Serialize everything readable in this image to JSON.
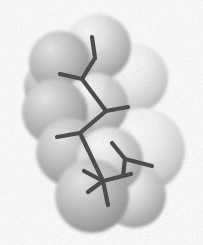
{
  "image": {
    "title": "Space-filling molecular model with stick skeleton",
    "subject": "branched alkane molecule",
    "representation": "van der Waals surface (CPK) with overlaid wireframe bonds",
    "background_color": "#ffffff",
    "width": 203,
    "height": 245,
    "color_mode": "grayscale",
    "texture": "dithered / halftone stippling"
  },
  "palette": {
    "background": "#ffffff",
    "sphere_light": "#f2f2f2",
    "sphere_mid": "#c9c9c9",
    "sphere_dark": "#9a9a9a",
    "sphere_edge": "#8a8a8a",
    "highlight": "#fbfbfb",
    "bond_color": "#3b3b3b",
    "bond_shadow": "#2b2b2b"
  },
  "surface": {
    "label": "van-der-waals-surface",
    "atom_count": 11,
    "atoms": [
      {
        "id": "sphere-1",
        "cx": 98,
        "cy": 47,
        "r": 33,
        "tone": "#c4c4c4",
        "light": "#eeeeee"
      },
      {
        "id": "sphere-2",
        "cx": 60,
        "cy": 62,
        "r": 31,
        "tone": "#b4b4b4",
        "light": "#e2e2e2"
      },
      {
        "id": "sphere-3",
        "cx": 133,
        "cy": 78,
        "r": 35,
        "tone": "#cfcfcf",
        "light": "#f4f4f4"
      },
      {
        "id": "sphere-4",
        "cx": 55,
        "cy": 112,
        "r": 33,
        "tone": "#b0b0b0",
        "light": "#dedede"
      },
      {
        "id": "sphere-5",
        "cx": 96,
        "cy": 105,
        "r": 32,
        "tone": "#c6c6c6",
        "light": "#efefef"
      },
      {
        "id": "sphere-6",
        "cx": 143,
        "cy": 150,
        "r": 42,
        "tone": "#dcdcdc",
        "light": "#fafafa"
      },
      {
        "id": "sphere-7",
        "cx": 70,
        "cy": 152,
        "r": 34,
        "tone": "#b6b6b6",
        "light": "#e4e4e4"
      },
      {
        "id": "sphere-8",
        "cx": 110,
        "cy": 160,
        "r": 33,
        "tone": "#c0c0c0",
        "light": "#ececec"
      },
      {
        "id": "sphere-9",
        "cx": 92,
        "cy": 196,
        "r": 37,
        "tone": "#a9a9a9",
        "light": "#d8d8d8"
      },
      {
        "id": "sphere-10",
        "cx": 134,
        "cy": 196,
        "r": 32,
        "tone": "#bdbdbd",
        "light": "#e8e8e8"
      },
      {
        "id": "sphere-11",
        "cx": 48,
        "cy": 86,
        "r": 24,
        "tone": "#a8a8a8",
        "light": "#d4d4d4"
      }
    ]
  },
  "skeleton": {
    "label": "bond-wireframe",
    "bond_width": 4.2,
    "vertices": [
      {
        "id": "v1",
        "x": 95,
        "y": 58,
        "type": "backbone"
      },
      {
        "id": "v2",
        "x": 82,
        "y": 79,
        "type": "branch"
      },
      {
        "id": "v3",
        "x": 106,
        "y": 111,
        "type": "branch"
      },
      {
        "id": "v4",
        "x": 80,
        "y": 133,
        "type": "branch"
      },
      {
        "id": "v5",
        "x": 103,
        "y": 181,
        "type": "branch"
      },
      {
        "id": "v6",
        "x": 125,
        "y": 159,
        "type": "branch"
      }
    ],
    "bonds": [
      {
        "id": "b1",
        "x1": 95,
        "y1": 58,
        "x2": 82,
        "y2": 79
      },
      {
        "id": "b2",
        "x1": 95,
        "y1": 58,
        "x2": 92,
        "y2": 37
      },
      {
        "id": "b3",
        "x1": 82,
        "y1": 79,
        "x2": 60,
        "y2": 74
      },
      {
        "id": "b4",
        "x1": 82,
        "y1": 79,
        "x2": 106,
        "y2": 111
      },
      {
        "id": "b5",
        "x1": 106,
        "y1": 111,
        "x2": 128,
        "y2": 107
      },
      {
        "id": "b6",
        "x1": 106,
        "y1": 111,
        "x2": 80,
        "y2": 133
      },
      {
        "id": "b7",
        "x1": 80,
        "y1": 133,
        "x2": 57,
        "y2": 137
      },
      {
        "id": "b8",
        "x1": 80,
        "y1": 133,
        "x2": 103,
        "y2": 181
      },
      {
        "id": "b9",
        "x1": 103,
        "y1": 181,
        "x2": 84,
        "y2": 171
      },
      {
        "id": "b10",
        "x1": 103,
        "y1": 181,
        "x2": 131,
        "y2": 174
      },
      {
        "id": "b11",
        "x1": 103,
        "y1": 181,
        "x2": 108,
        "y2": 205
      },
      {
        "id": "b12",
        "x1": 103,
        "y1": 181,
        "x2": 88,
        "y2": 192
      },
      {
        "id": "b13",
        "x1": 125,
        "y1": 159,
        "x2": 112,
        "y2": 143
      },
      {
        "id": "b14",
        "x1": 125,
        "y1": 159,
        "x2": 152,
        "y2": 166
      },
      {
        "id": "b15",
        "x1": 125,
        "y1": 159,
        "x2": 123,
        "y2": 176
      }
    ]
  }
}
